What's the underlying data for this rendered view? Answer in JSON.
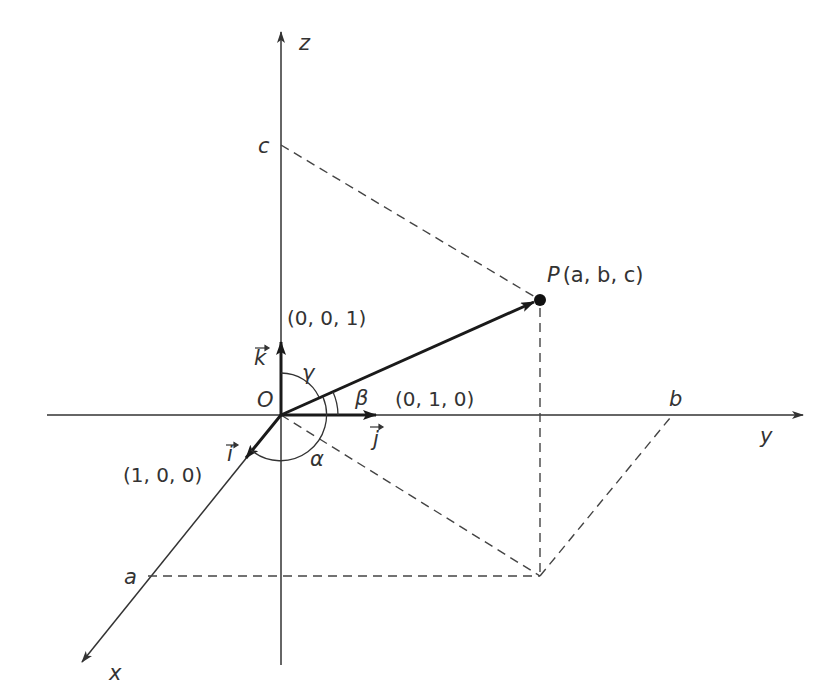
{
  "figure": {
    "colors": {
      "axis": "#333333",
      "vector": "#1a1a1a",
      "dashed": "#444444",
      "background": "#ffffff"
    }
  },
  "axes": {
    "x_label": "x",
    "y_label": "y",
    "z_label": "z",
    "origin_label": "O"
  },
  "intercepts": {
    "a": "a",
    "b": "b",
    "c": "c"
  },
  "point": {
    "name": "P",
    "coords_label": "(a, b, c)"
  },
  "unit_vectors": {
    "i": {
      "symbol": "i",
      "coords": "(1, 0, 0)"
    },
    "j": {
      "symbol": "j",
      "coords": "(0, 1, 0)"
    },
    "k": {
      "symbol": "k",
      "coords": "(0, 0, 1)"
    }
  },
  "angles": {
    "alpha": "α",
    "beta": "β",
    "gamma": "γ"
  }
}
